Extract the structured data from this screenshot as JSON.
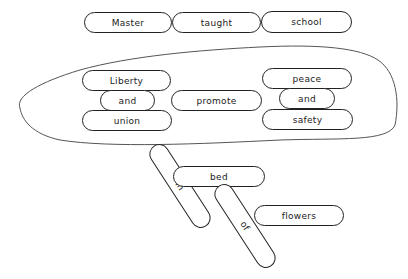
{
  "top_row": [
    "Master",
    "taught",
    "school"
  ],
  "left_group": [
    "Liberty",
    "and",
    "union"
  ],
  "center_word": "promote",
  "right_group": [
    "peace",
    "and",
    "safety"
  ],
  "bottom": {
    "in": "in",
    "bed": "bed",
    "of": "of",
    "flowers": "flowers"
  }
}
